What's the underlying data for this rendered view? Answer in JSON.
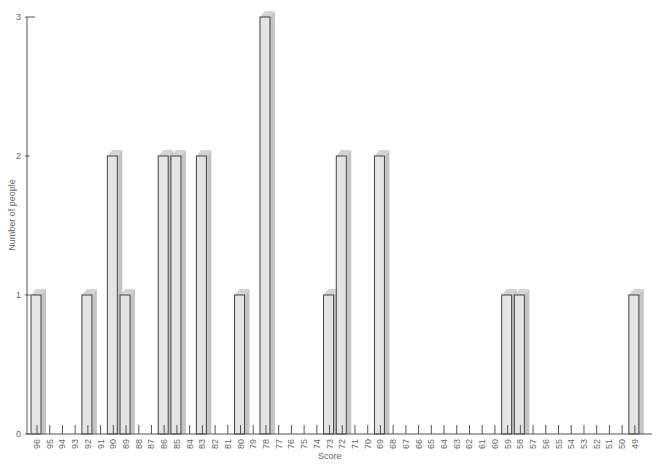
{
  "chart_data": {
    "type": "bar",
    "title": "",
    "xlabel": "Score",
    "ylabel": "Number of people",
    "ylim": [
      0,
      3
    ],
    "yticks": [
      0,
      1,
      2,
      3
    ],
    "grid": false,
    "style": "3d-shadowed-bars",
    "categories": [
      "96",
      "95",
      "94",
      "93",
      "92",
      "91",
      "90",
      "89",
      "88",
      "87",
      "86",
      "85",
      "84",
      "83",
      "82",
      "81",
      "80",
      "79",
      "78",
      "77",
      "76",
      "75",
      "74",
      "73",
      "72",
      "71",
      "70",
      "69",
      "68",
      "67",
      "66",
      "65",
      "64",
      "63",
      "62",
      "61",
      "60",
      "59",
      "58",
      "57",
      "56",
      "55",
      "54",
      "53",
      "52",
      "51",
      "50",
      "49"
    ],
    "values": [
      1,
      0,
      0,
      0,
      1,
      0,
      2,
      1,
      0,
      0,
      2,
      2,
      0,
      2,
      0,
      0,
      1,
      0,
      3,
      0,
      0,
      0,
      0,
      1,
      2,
      0,
      0,
      2,
      0,
      0,
      0,
      0,
      0,
      0,
      0,
      0,
      0,
      1,
      1,
      0,
      0,
      0,
      0,
      0,
      0,
      0,
      0,
      1
    ]
  },
  "colors": {
    "bar_face": "#e4e4e4",
    "bar_shadow": "#c4c4c4",
    "bar_outline": "#444444",
    "axis": "#555555"
  }
}
